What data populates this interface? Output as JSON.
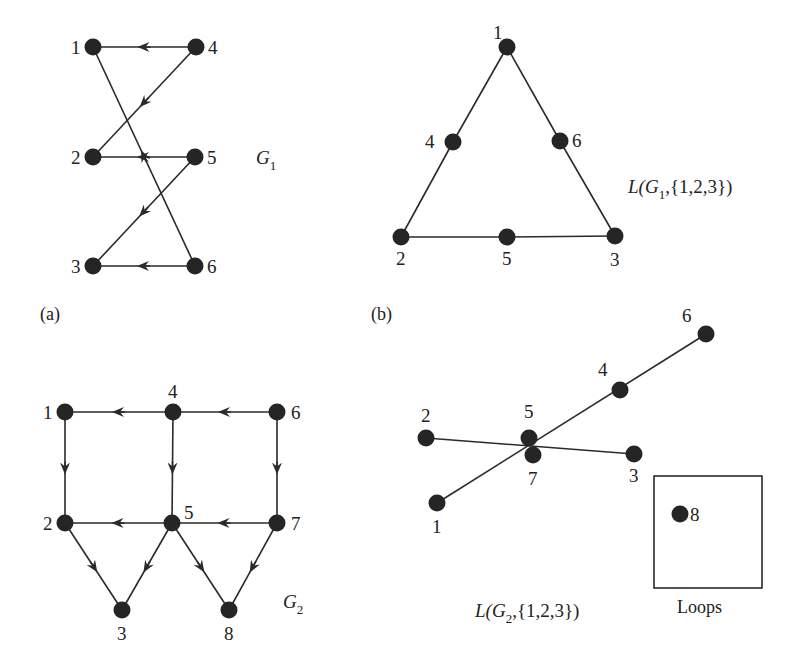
{
  "figure": {
    "panels": [
      {
        "id": "a",
        "label": "(a)"
      },
      {
        "id": "b",
        "label": "(b)"
      }
    ],
    "G1": {
      "name": "G",
      "subscript": "1",
      "nodes": [
        {
          "id": "1",
          "x": 93,
          "y": 47
        },
        {
          "id": "4",
          "x": 196,
          "y": 47
        },
        {
          "id": "2",
          "x": 93,
          "y": 157
        },
        {
          "id": "5",
          "x": 195,
          "y": 157
        },
        {
          "id": "3",
          "x": 93,
          "y": 266
        },
        {
          "id": "6",
          "x": 195,
          "y": 266
        }
      ],
      "edges": [
        {
          "from": "4",
          "to": "1"
        },
        {
          "from": "4",
          "to": "2"
        },
        {
          "from": "5",
          "to": "2"
        },
        {
          "from": "5",
          "to": "3"
        },
        {
          "from": "6",
          "to": "3"
        },
        {
          "from": "6",
          "to": "1"
        }
      ]
    },
    "LG1": {
      "title_prefix": "L(G",
      "subscript": "1",
      "title_suffix": ",{1,2,3})",
      "nodes": [
        {
          "id": "1",
          "x": 507,
          "y": 47
        },
        {
          "id": "4",
          "x": 453,
          "y": 142
        },
        {
          "id": "6",
          "x": 560,
          "y": 141
        },
        {
          "id": "2",
          "x": 401,
          "y": 237
        },
        {
          "id": "5",
          "x": 507,
          "y": 237
        },
        {
          "id": "3",
          "x": 615,
          "y": 236
        }
      ],
      "edges": [
        {
          "from": "1",
          "to": "4"
        },
        {
          "from": "4",
          "to": "2"
        },
        {
          "from": "1",
          "to": "6"
        },
        {
          "from": "6",
          "to": "3"
        },
        {
          "from": "2",
          "to": "5"
        },
        {
          "from": "5",
          "to": "3"
        }
      ]
    },
    "G2": {
      "name": "G",
      "subscript": "2",
      "nodes": [
        {
          "id": "1",
          "x": 65,
          "y": 412
        },
        {
          "id": "4",
          "x": 173,
          "y": 412
        },
        {
          "id": "6",
          "x": 277,
          "y": 412
        },
        {
          "id": "2",
          "x": 65,
          "y": 523
        },
        {
          "id": "5",
          "x": 172,
          "y": 523
        },
        {
          "id": "7",
          "x": 277,
          "y": 523
        },
        {
          "id": "3",
          "x": 122,
          "y": 610
        },
        {
          "id": "8",
          "x": 229,
          "y": 610
        }
      ],
      "edges": [
        {
          "from": "4",
          "to": "1"
        },
        {
          "from": "6",
          "to": "4"
        },
        {
          "from": "1",
          "to": "2"
        },
        {
          "from": "4",
          "to": "5"
        },
        {
          "from": "6",
          "to": "7"
        },
        {
          "from": "5",
          "to": "2"
        },
        {
          "from": "7",
          "to": "5"
        },
        {
          "from": "2",
          "to": "3"
        },
        {
          "from": "5",
          "to": "3"
        },
        {
          "from": "5",
          "to": "8"
        },
        {
          "from": "7",
          "to": "8"
        }
      ]
    },
    "LG2": {
      "title_prefix": "L(G",
      "subscript": "2",
      "title_suffix": ",{1,2,3})",
      "nodes": [
        {
          "id": "6",
          "x": 706,
          "y": 334
        },
        {
          "id": "4",
          "x": 620,
          "y": 390
        },
        {
          "id": "2",
          "x": 426,
          "y": 438
        },
        {
          "id": "5",
          "x": 529,
          "y": 438
        },
        {
          "id": "7",
          "x": 533,
          "y": 455
        },
        {
          "id": "3",
          "x": 634,
          "y": 454
        },
        {
          "id": "1",
          "x": 437,
          "y": 503
        }
      ],
      "edges": [
        {
          "from": "1",
          "to": "6"
        },
        {
          "from": "2",
          "to": "3"
        }
      ],
      "loops_box": {
        "label": "Loops",
        "nodes": [
          {
            "id": "8",
            "x": 680,
            "y": 514
          }
        ]
      }
    }
  }
}
